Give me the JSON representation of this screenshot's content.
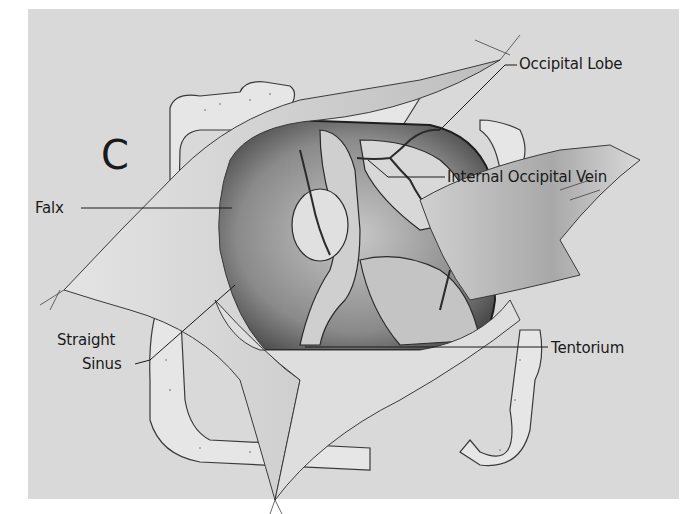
{
  "figure": {
    "panel_letter": "C",
    "background_color": "#d9d9d9",
    "labels": {
      "occipital_lobe": "Occipital Lobe",
      "internal_occipital_vein": "Internal Occipital Vein",
      "falx": "Falx",
      "straight_sinus_line1": "Straight",
      "straight_sinus_line2": "Sinus",
      "tentorium": "Tentorium"
    }
  }
}
